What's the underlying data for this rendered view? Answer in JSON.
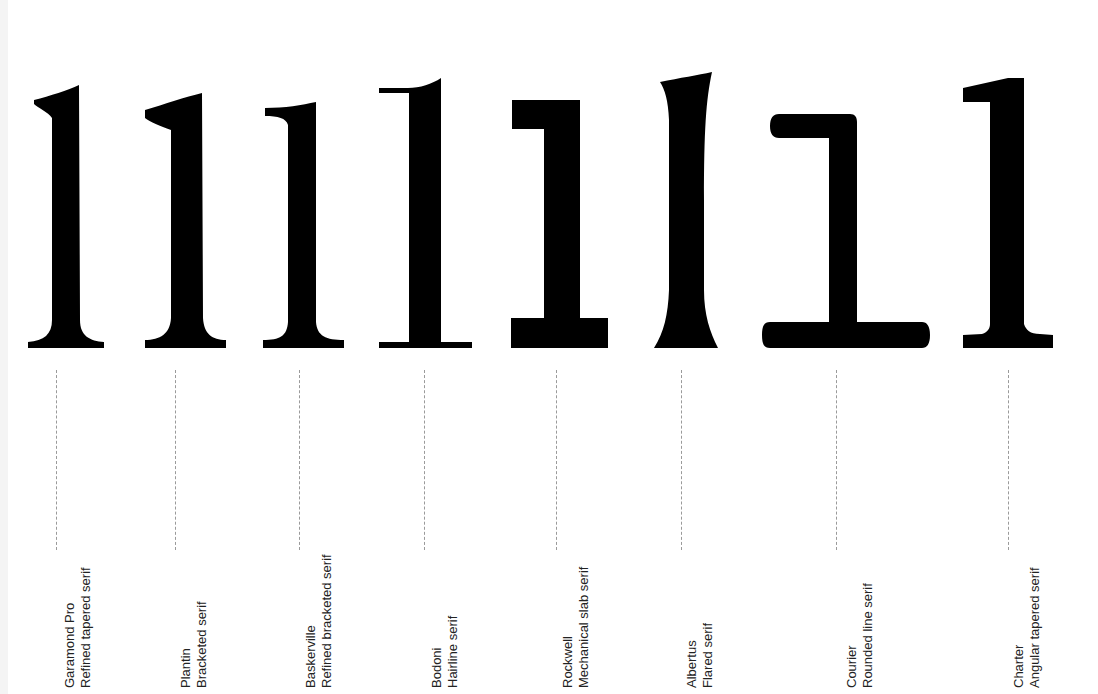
{
  "glyph_char": "1",
  "colors": {
    "glyph": "#000000",
    "leader": "#9a9a9a",
    "label": "#222222"
  },
  "specimens": [
    {
      "name": "Garamond Pro",
      "serif": "Refined tapered serif"
    },
    {
      "name": "Plantin",
      "serif": "Bracketed serif"
    },
    {
      "name": "Baskerville",
      "serif": "Refined bracketed serif"
    },
    {
      "name": "Bodoni",
      "serif": "Hairline serif"
    },
    {
      "name": "Rockwell",
      "serif": "Mechanical slab serif"
    },
    {
      "name": "Albertus",
      "serif": "Flared serif"
    },
    {
      "name": "Courier",
      "serif": "Rounded line serif"
    },
    {
      "name": "Charter",
      "serif": "Angular tapered serif"
    }
  ]
}
